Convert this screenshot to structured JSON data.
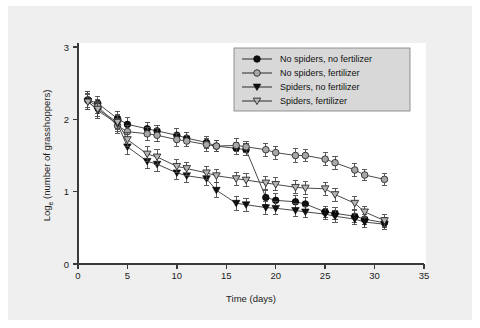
{
  "figure": {
    "background_color": "#efefef",
    "page_color": "#ffffff"
  },
  "chart_data": {
    "type": "line",
    "title": "",
    "xlabel": "Time (days)",
    "ylabel": "Logₑ (number of grasshoppers)",
    "ylabel_base": "Log",
    "ylabel_sub": "e",
    "ylabel_rest": " (number of grasshoppers)",
    "xlim": [
      0,
      35
    ],
    "ylim": [
      0,
      3
    ],
    "xticks": [
      0,
      5,
      10,
      15,
      20,
      25,
      30,
      35
    ],
    "xticklabels": [
      "0",
      "5",
      "10",
      "15",
      "20",
      "25",
      "30",
      "35"
    ],
    "yticks": [
      0,
      1,
      2,
      3
    ],
    "yticklabels": [
      "0",
      "1",
      "2",
      "3"
    ],
    "grid": false,
    "legend_position": "upper right",
    "error_bars": "standard error",
    "series": [
      {
        "name": "No spiders, no fertilizer",
        "marker": "filled-circle",
        "color": "#111111",
        "x": [
          1,
          2,
          4,
          5,
          7,
          8,
          10,
          11,
          13,
          14,
          16,
          17,
          19,
          20,
          22,
          23,
          25,
          26,
          28,
          29,
          31
        ],
        "y": [
          2.27,
          2.22,
          2.01,
          1.93,
          1.87,
          1.84,
          1.78,
          1.74,
          1.68,
          1.63,
          1.6,
          1.58,
          0.92,
          0.88,
          0.86,
          0.83,
          0.72,
          0.7,
          0.66,
          0.62,
          0.57
        ],
        "err": [
          0.11,
          0.1,
          0.1,
          0.09,
          0.09,
          0.08,
          0.09,
          0.08,
          0.08,
          0.08,
          0.08,
          0.08,
          0.1,
          0.09,
          0.09,
          0.09,
          0.08,
          0.08,
          0.08,
          0.07,
          0.07
        ]
      },
      {
        "name": "No spiders, fertilizer",
        "marker": "open-circle",
        "color": "#9a9a9a",
        "x": [
          1,
          2,
          4,
          5,
          7,
          8,
          10,
          11,
          13,
          14,
          16,
          17,
          19,
          20,
          22,
          23,
          25,
          26,
          28,
          29,
          31
        ],
        "y": [
          2.26,
          2.18,
          1.91,
          1.83,
          1.8,
          1.78,
          1.72,
          1.7,
          1.65,
          1.63,
          1.64,
          1.62,
          1.58,
          1.54,
          1.5,
          1.5,
          1.45,
          1.4,
          1.3,
          1.23,
          1.17
        ],
        "err": [
          0.12,
          0.1,
          0.1,
          0.09,
          0.09,
          0.09,
          0.09,
          0.08,
          0.09,
          0.08,
          0.09,
          0.08,
          0.09,
          0.09,
          0.09,
          0.08,
          0.09,
          0.09,
          0.09,
          0.08,
          0.08
        ]
      },
      {
        "name": "Spiders, no fertilizer",
        "marker": "filled-triangle-down",
        "color": "#111111",
        "x": [
          1,
          2,
          4,
          5,
          7,
          8,
          10,
          11,
          13,
          14,
          16,
          17,
          19,
          20,
          22,
          23,
          25,
          26,
          28,
          29,
          31
        ],
        "y": [
          2.25,
          2.12,
          1.94,
          1.62,
          1.42,
          1.38,
          1.26,
          1.22,
          1.18,
          1.02,
          0.84,
          0.82,
          0.78,
          0.77,
          0.74,
          0.72,
          0.69,
          0.66,
          0.62,
          0.58,
          0.55
        ],
        "err": [
          0.11,
          0.11,
          0.11,
          0.11,
          0.1,
          0.1,
          0.09,
          0.09,
          0.09,
          0.1,
          0.1,
          0.09,
          0.09,
          0.09,
          0.09,
          0.08,
          0.08,
          0.08,
          0.08,
          0.08,
          0.07
        ]
      },
      {
        "name": "Spiders, fertilizer",
        "marker": "open-triangle-down",
        "color": "#9a9a9a",
        "x": [
          1,
          2,
          4,
          5,
          7,
          8,
          10,
          11,
          13,
          14,
          16,
          17,
          19,
          20,
          22,
          23,
          25,
          26,
          28,
          29,
          31
        ],
        "y": [
          2.24,
          2.14,
          1.96,
          1.72,
          1.52,
          1.48,
          1.35,
          1.32,
          1.26,
          1.22,
          1.18,
          1.16,
          1.12,
          1.1,
          1.06,
          1.05,
          1.04,
          0.96,
          0.84,
          0.72,
          0.6
        ],
        "err": [
          0.11,
          0.1,
          0.1,
          0.1,
          0.1,
          0.1,
          0.09,
          0.09,
          0.09,
          0.09,
          0.09,
          0.09,
          0.09,
          0.09,
          0.09,
          0.09,
          0.09,
          0.09,
          0.09,
          0.08,
          0.08
        ]
      }
    ]
  }
}
